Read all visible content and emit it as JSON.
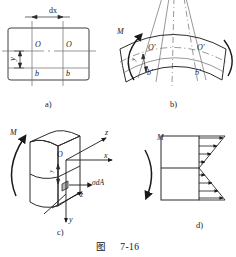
{
  "figure": {
    "caption_prefix": "图",
    "caption_number": "7-16",
    "stroke_color": "#2b2b2b",
    "thin_color": "#6b6b6b",
    "background": "#ffffff"
  },
  "panels": [
    {
      "tag": "a)",
      "name": "undeformed-beam-element",
      "labels": {
        "dx": "dx",
        "origin_left": "O",
        "origin_right": "O",
        "y": "y",
        "b_left": "b",
        "b_right": "b"
      }
    },
    {
      "tag": "b)",
      "name": "deformed-beam-element",
      "labels": {
        "moment": "M",
        "origin_left": "O'",
        "origin_right": "O'",
        "y": "y",
        "b_left": "b'",
        "b_right": "b'"
      }
    },
    {
      "tag": "c)",
      "name": "stress-element-3d",
      "labels": {
        "moment": "M",
        "origin": "O",
        "axis_x": "x",
        "axis_y": "y",
        "axis_z_upper": "z",
        "axis_z_lower": "z",
        "force": "σdA",
        "y": "y"
      }
    },
    {
      "tag": "d)",
      "name": "stress-distribution",
      "labels": {
        "moment": "M"
      }
    }
  ]
}
